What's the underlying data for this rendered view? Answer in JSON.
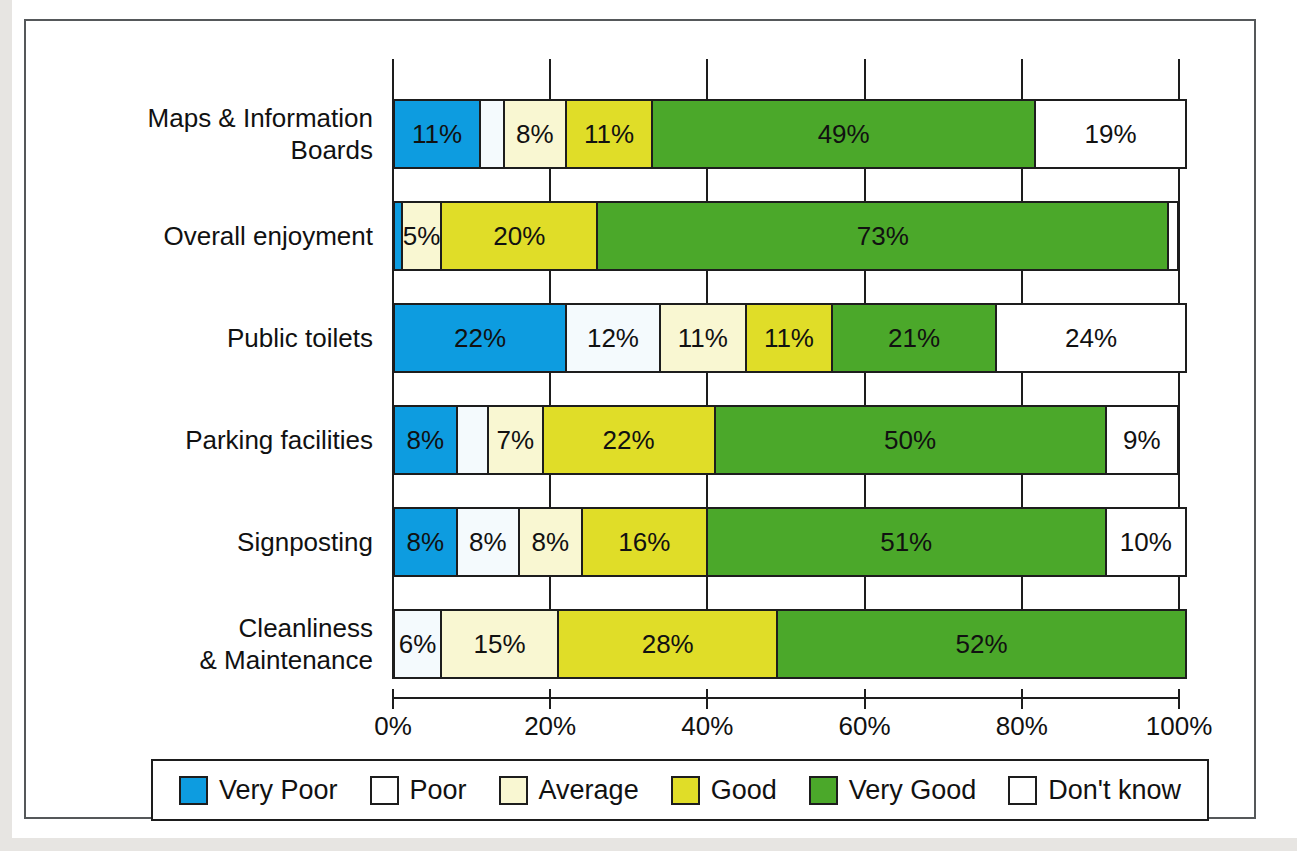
{
  "chart_data": {
    "type": "bar",
    "subtype": "stacked-horizontal-100pct",
    "title": "",
    "xlabel": "",
    "ylabel": "",
    "xlim": [
      0,
      100
    ],
    "xticks": [
      0,
      20,
      40,
      60,
      80,
      100
    ],
    "xtick_labels": [
      "0%",
      "20%",
      "40%",
      "60%",
      "80%",
      "100%"
    ],
    "grid": true,
    "legend_position": "bottom",
    "categories": [
      "Maps & Information Boards",
      "Overall enjoyment",
      "Public toilets",
      "Parking facilities",
      "Signposting",
      "Cleanliness & Maintenance"
    ],
    "series": [
      {
        "name": "Very Poor",
        "color": "#0d9ce0",
        "values": [
          11,
          1,
          22,
          8,
          8,
          0
        ]
      },
      {
        "name": "Poor",
        "color": "#f4fafd",
        "values": [
          3,
          0,
          12,
          4,
          8,
          6
        ]
      },
      {
        "name": "Average",
        "color": "#f9f7d2",
        "values": [
          8,
          5,
          11,
          7,
          8,
          15
        ]
      },
      {
        "name": "Good",
        "color": "#e0dd28",
        "values": [
          11,
          20,
          11,
          22,
          16,
          28
        ]
      },
      {
        "name": "Very Good",
        "color": "#4ba82a",
        "values": [
          49,
          73,
          21,
          50,
          51,
          52
        ]
      },
      {
        "name": "Don't know",
        "color": "#ffffff",
        "values": [
          19,
          1,
          24,
          9,
          10,
          0
        ]
      }
    ],
    "data_labels": [
      [
        "11%",
        "",
        "8%",
        "11%",
        "49%",
        "19%"
      ],
      [
        "",
        "",
        "5%",
        "20%",
        "73%",
        ""
      ],
      [
        "22%",
        "12%",
        "11%",
        "11%",
        "21%",
        "24%"
      ],
      [
        "8%",
        "",
        "7%",
        "22%",
        "50%",
        "9%"
      ],
      [
        "8%",
        "8%",
        "8%",
        "16%",
        "51%",
        "10%"
      ],
      [
        "",
        "6%",
        "15%",
        "28%",
        "52%",
        ""
      ]
    ]
  },
  "axis": {
    "ticks": [
      {
        "label": "0%",
        "value": 0
      },
      {
        "label": "20%",
        "value": 20
      },
      {
        "label": "40%",
        "value": 40
      },
      {
        "label": "60%",
        "value": 60
      },
      {
        "label": "80%",
        "value": 80
      },
      {
        "label": "100%",
        "value": 100
      }
    ]
  },
  "categories": [
    {
      "line1": "Maps & Information",
      "line2": "Boards"
    },
    {
      "line1": "Overall enjoyment",
      "line2": ""
    },
    {
      "line1": "Public toilets",
      "line2": ""
    },
    {
      "line1": "Parking facilities",
      "line2": ""
    },
    {
      "line1": "Signposting",
      "line2": ""
    },
    {
      "line1": "Cleanliness",
      "line2": "& Maintenance"
    }
  ],
  "legend": {
    "items": [
      {
        "label": "Very Poor",
        "color": "#0d9ce0"
      },
      {
        "label": "Poor",
        "color": "#ffffff"
      },
      {
        "label": "Average",
        "color": "#f9f7d2"
      },
      {
        "label": "Good",
        "color": "#e0dd28"
      },
      {
        "label": "Very Good",
        "color": "#4ba82a"
      },
      {
        "label": "Don't know",
        "color": "#ffffff"
      }
    ]
  }
}
